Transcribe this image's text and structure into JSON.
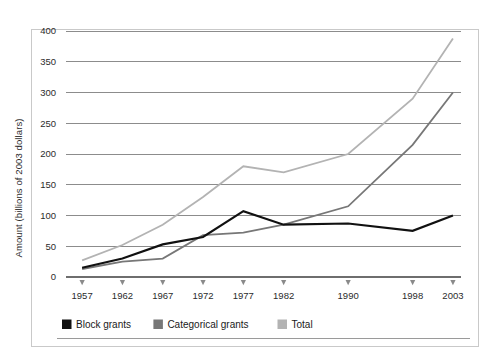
{
  "chart_data": {
    "type": "line",
    "title": "",
    "xlabel": "",
    "ylabel": "Amount (billions of 2003 dollars)",
    "categories": [
      "1957",
      "1962",
      "1967",
      "1972",
      "1977",
      "1982",
      "1990",
      "1998",
      "2003"
    ],
    "x": [
      1957,
      1962,
      1967,
      1972,
      1977,
      1982,
      1990,
      1998,
      2003
    ],
    "xlim": [
      1955,
      2004
    ],
    "ylim": [
      0,
      400
    ],
    "yticks": [
      0,
      50,
      100,
      150,
      200,
      250,
      300,
      350,
      400
    ],
    "ytick_labels": [
      "0",
      "50",
      "100",
      "150",
      "200",
      "250",
      "300",
      "350",
      "400"
    ],
    "grid": "horizontal",
    "legend_position": "bottom-left",
    "series": [
      {
        "name": "Block grants",
        "color": "#111111",
        "width": 2.2,
        "values": [
          15,
          30,
          53,
          65,
          107,
          85,
          87,
          75,
          100
        ]
      },
      {
        "name": "Categorical grants",
        "color": "#777777",
        "width": 1.8,
        "values": [
          13,
          25,
          30,
          68,
          72,
          85,
          115,
          215,
          300
        ]
      },
      {
        "name": "Total",
        "color": "#b3b3b3",
        "width": 1.8,
        "values": [
          27,
          52,
          85,
          130,
          180,
          170,
          200,
          290,
          388
        ]
      }
    ]
  },
  "axes": {
    "y_axis_title": "Amount (billions of 2003 dollars)"
  },
  "legend": {
    "items": [
      {
        "label": "Block grants",
        "color": "#111111"
      },
      {
        "label": "Categorical grants",
        "color": "#777777"
      },
      {
        "label": "Total",
        "color": "#b3b3b3"
      }
    ]
  }
}
